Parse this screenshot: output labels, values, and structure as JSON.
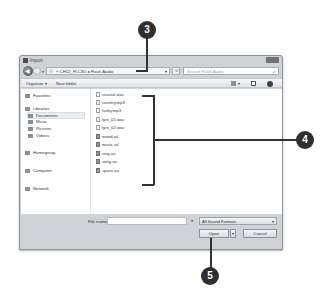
{
  "window": {
    "title": "Import",
    "address": {
      "path": [
        "CH12_FLCS5",
        "Flash Audio"
      ],
      "separator": "▸",
      "text": "« CH12_FLCS5 ▸ Flash Audio"
    },
    "search": {
      "placeholder": "Search Flash Audio"
    },
    "toolbar": {
      "organize": "Organize ▾",
      "new_folder": "New folder"
    },
    "nav_pane": {
      "items": [
        {
          "label": "Favorites",
          "icon": "star-icon"
        },
        {
          "label": "Libraries",
          "icon": "library-icon"
        },
        {
          "label": "Documents",
          "icon": "documents-icon",
          "selected": true
        },
        {
          "label": "Music",
          "icon": "music-icon"
        },
        {
          "label": "Pictures",
          "icon": "pictures-icon"
        },
        {
          "label": "Videos",
          "icon": "videos-icon"
        },
        {
          "label": "Homegroup",
          "icon": "homegroup-icon"
        },
        {
          "label": "Computer",
          "icon": "computer-icon"
        },
        {
          "label": "Network",
          "icon": "network-icon"
        }
      ]
    },
    "files": [
      {
        "name": "coastal.wav",
        "type": "wav"
      },
      {
        "name": "country.mp3",
        "type": "mp3"
      },
      {
        "name": "funky.mp3",
        "type": "mp3"
      },
      {
        "name": "lyre_01.wav",
        "type": "wav"
      },
      {
        "name": "lyre_02.wav",
        "type": "wav"
      },
      {
        "name": "mood.aif",
        "type": "aif"
      },
      {
        "name": "music.aif",
        "type": "aif"
      },
      {
        "name": "sing.au",
        "type": "au"
      },
      {
        "name": "song.au",
        "type": "au"
      },
      {
        "name": "space.au",
        "type": "au"
      }
    ],
    "bottom": {
      "file_name_label": "File name:",
      "file_name_value": "",
      "filter": "All Sound Formats",
      "open": "Open",
      "cancel": "Cancel"
    }
  },
  "callouts": [
    {
      "number": "3",
      "target": "address-bar"
    },
    {
      "number": "4",
      "target": "file-list"
    },
    {
      "number": "5",
      "target": "open-button"
    }
  ]
}
